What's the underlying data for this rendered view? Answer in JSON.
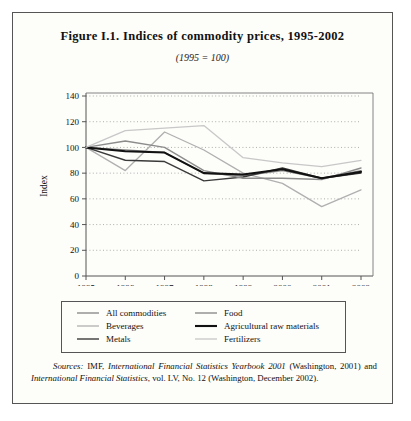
{
  "figure": {
    "title": "Figure I.1.  Indices of commodity prices, 1995-2002",
    "subtitle": "(1995 = 100)"
  },
  "legend": {
    "items": [
      {
        "label": "All commodities",
        "color": "#8c8c8c",
        "width": 1.4
      },
      {
        "label": "Beverages",
        "color": "#b0b0b0",
        "width": 1.3
      },
      {
        "label": "Metals",
        "color": "#3a3a3a",
        "width": 1.4
      },
      {
        "label": "Food",
        "color": "#8c8c8c",
        "width": 1.4
      },
      {
        "label": "Agricultural raw materials",
        "color": "#111111",
        "width": 2.1
      },
      {
        "label": "Fertilizers",
        "color": "#c8c8c8",
        "width": 1.3
      }
    ]
  },
  "sources": {
    "label": "Sources:",
    "text_1": " IMF, ",
    "italic_1": "International Financial Statistics Yearbook 2001",
    "text_2": " (Washington, 2001) and ",
    "italic_2": "International Financial Statistics",
    "text_3": ", vol. LV, No. 12 (Washington, December 2002)."
  },
  "chart_data": {
    "type": "line",
    "title": "Indices of commodity prices, 1995-2002",
    "subtitle": "(1995 = 100)",
    "xlabel": "",
    "ylabel": "Index",
    "x_note": "(October)",
    "categories": [
      "1995",
      "1996",
      "1997",
      "1998",
      "1999",
      "2000",
      "2001",
      "2002"
    ],
    "xlim": [
      1995,
      2002
    ],
    "ylim": [
      0,
      140
    ],
    "yticks": [
      0,
      20,
      40,
      60,
      80,
      100,
      120,
      140
    ],
    "grid": "horizontal-dotted",
    "legend_position": "below",
    "series": [
      {
        "name": "All commodities",
        "color": "#8c8c8c",
        "width": 1.4,
        "values": [
          100,
          98,
          96,
          80,
          78,
          82,
          76,
          82
        ]
      },
      {
        "name": "Beverages",
        "color": "#b0b0b0",
        "width": 1.3,
        "values": [
          100,
          82,
          112,
          98,
          80,
          72,
          54,
          67
        ]
      },
      {
        "name": "Metals",
        "color": "#3a3a3a",
        "width": 1.4,
        "values": [
          100,
          90,
          89,
          74,
          77,
          84,
          76,
          80
        ]
      },
      {
        "name": "Food",
        "color": "#8c8c8c",
        "width": 1.4,
        "values": [
          100,
          105,
          100,
          82,
          76,
          76,
          75,
          84
        ]
      },
      {
        "name": "Agricultural raw materials",
        "color": "#111111",
        "width": 2.1,
        "values": [
          100,
          97,
          96,
          80,
          79,
          83,
          76,
          81
        ]
      },
      {
        "name": "Fertilizers",
        "color": "#c8c8c8",
        "width": 1.3,
        "values": [
          100,
          113,
          115,
          117,
          92,
          88,
          85,
          90
        ]
      }
    ]
  }
}
